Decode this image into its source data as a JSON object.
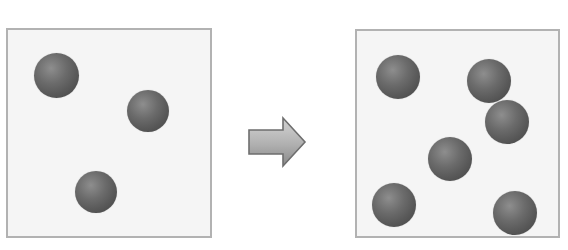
{
  "figure": {
    "title": "",
    "type": "before-after-particle-diagram",
    "background_color": "#ffffff",
    "transition_icon": "right-block-arrow-icon"
  },
  "palette": {
    "box_fill": "#f5f5f5",
    "box_border": "#b2b2b2",
    "particle_highlight": "#8e8e8e",
    "particle_shadow": "#454545",
    "arrow_fill_light": "#c9c9c9",
    "arrow_fill_dark": "#8f8f8f",
    "arrow_border": "#6e6e6e"
  },
  "panels": [
    {
      "id": "before",
      "label": "",
      "particle_count": 3,
      "box": {
        "x": 6,
        "y": 28,
        "width": 206,
        "height": 210
      },
      "particles": [
        {
          "id": "before-particle-1",
          "cx": 56,
          "cy": 75,
          "d": 45
        },
        {
          "id": "before-particle-2",
          "cx": 148,
          "cy": 111,
          "d": 42
        },
        {
          "id": "before-particle-3",
          "cx": 96,
          "cy": 192,
          "d": 42
        }
      ]
    },
    {
      "id": "after",
      "label": "",
      "particle_count": 6,
      "box": {
        "x": 355,
        "y": 29,
        "width": 205,
        "height": 209
      },
      "particles": [
        {
          "id": "after-particle-1",
          "cx": 398,
          "cy": 77,
          "d": 44
        },
        {
          "id": "after-particle-2",
          "cx": 489,
          "cy": 81,
          "d": 44
        },
        {
          "id": "after-particle-3",
          "cx": 507,
          "cy": 122,
          "d": 44
        },
        {
          "id": "after-particle-4",
          "cx": 450,
          "cy": 159,
          "d": 44
        },
        {
          "id": "after-particle-5",
          "cx": 394,
          "cy": 205,
          "d": 44
        },
        {
          "id": "after-particle-6",
          "cx": 515,
          "cy": 213,
          "d": 44
        }
      ]
    }
  ],
  "arrow": {
    "name": "right-block-arrow-icon",
    "x": 246,
    "y": 115,
    "width": 62,
    "height": 54,
    "direction": "right"
  }
}
